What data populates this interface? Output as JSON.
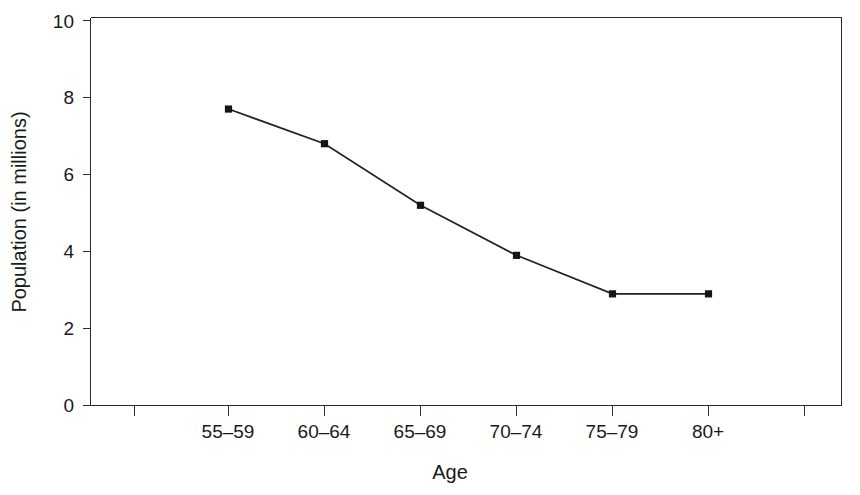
{
  "chart_data": {
    "type": "line",
    "title": "",
    "xlabel": "Age",
    "ylabel": "Population (in millions)",
    "categories": [
      "55–59",
      "60–64",
      "65–69",
      "70–74",
      "75–79",
      "80+"
    ],
    "values": [
      7.7,
      6.8,
      5.2,
      3.9,
      2.9,
      2.9
    ],
    "series": [
      {
        "name": "Population",
        "values": [
          7.7,
          6.8,
          5.2,
          3.9,
          2.9,
          2.9
        ]
      }
    ],
    "ylim": [
      0,
      10
    ],
    "y_ticks": [
      "0",
      "2",
      "4",
      "6",
      "8",
      "10"
    ],
    "y_tick_values": [
      0,
      2,
      4,
      6,
      8,
      10
    ],
    "x_tick_labels": [
      "",
      "55–59",
      "60–64",
      "65–69",
      "70–74",
      "75–79",
      "80+",
      ""
    ],
    "grid": false,
    "legend": false,
    "legend_position": "none",
    "marker": "square",
    "line_color": "#222222",
    "marker_color": "#161616",
    "axis_color": "#2b2b2b",
    "background_color": "#ffffff"
  },
  "axes": {
    "y_title": "Population (in millions)",
    "x_title": "Age"
  },
  "colors": {
    "line": "#222222",
    "marker": "#161616",
    "axis": "#2b2b2b",
    "background": "#ffffff",
    "text": "#1a1a1a"
  }
}
